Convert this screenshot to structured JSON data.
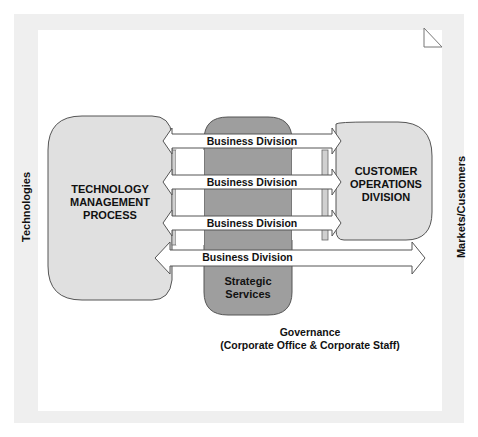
{
  "diagram": {
    "left_axis_label": "Technologies",
    "right_axis_label": "Markets/Customers",
    "left_box": {
      "lines": [
        "TECHNOLOGY",
        "MANAGEMENT",
        "PROCESS"
      ]
    },
    "right_box": {
      "lines": [
        "CUSTOMER",
        "OPERATIONS",
        "DIVISION"
      ]
    },
    "center_box": {
      "lines": [
        "Strategic",
        "Services"
      ]
    },
    "arrows": [
      {
        "label": "Business Division"
      },
      {
        "label": "Business Division"
      },
      {
        "label": "Business Division"
      },
      {
        "label": "Business Division"
      }
    ],
    "governance": {
      "line1": "Governance",
      "line2": "(Corporate Office & Corporate Staff)"
    },
    "corner_icon": "page-corner-triangle-icon",
    "colors": {
      "frame": "#efefef",
      "light_box": "#e0e0e0",
      "dark_box": "#9e9e9e",
      "arrow_fill": "#ffffff",
      "stroke": "#555555"
    }
  }
}
